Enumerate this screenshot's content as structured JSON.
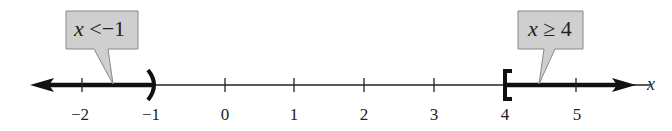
{
  "diagram": {
    "type": "number-line",
    "axis_label": "x",
    "ticks": [
      {
        "value": -2,
        "label": "−2",
        "x": 82
      },
      {
        "value": -1,
        "label": "−1",
        "x": 153
      },
      {
        "value": 0,
        "label": "0",
        "x": 225
      },
      {
        "value": 1,
        "label": "1",
        "x": 294
      },
      {
        "value": 2,
        "label": "2",
        "x": 364
      },
      {
        "value": 3,
        "label": "3",
        "x": 434
      },
      {
        "value": 4,
        "label": "4",
        "x": 505
      },
      {
        "value": 5,
        "label": "5",
        "x": 576
      }
    ],
    "intervals": [
      {
        "inequality": "x < −1",
        "endpoint": -1,
        "endpoint_type": "open",
        "bracket": ")",
        "direction": "left"
      },
      {
        "inequality": "x ≥ 4",
        "endpoint": 4,
        "endpoint_type": "closed",
        "bracket": "[",
        "direction": "right"
      }
    ],
    "callouts": [
      {
        "var": "x",
        "rel": "<",
        "num": "−1"
      },
      {
        "var": "x",
        "rel": "≥",
        "num": "4"
      }
    ],
    "colors": {
      "line": "#111111",
      "callout_fill": "#cfcfcf",
      "callout_stroke": "#888888"
    }
  }
}
